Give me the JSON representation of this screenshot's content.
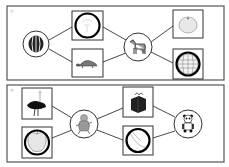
{
  "worksheet": {
    "panels": [
      {
        "label": "①",
        "nodes": [
          {
            "id": "watermelon",
            "shape": "circle",
            "picture": "watermelon",
            "marked": false
          },
          {
            "id": "sketch",
            "shape": "box",
            "picture": "faint-sketch",
            "marked": true
          },
          {
            "id": "turtle",
            "shape": "box",
            "picture": "turtle",
            "marked": false
          },
          {
            "id": "zebra",
            "shape": "circle",
            "picture": "zebra",
            "marked": false
          },
          {
            "id": "orange",
            "shape": "box",
            "picture": "orange",
            "marked": false
          },
          {
            "id": "globe",
            "shape": "box",
            "picture": "globe-ball",
            "marked": true
          }
        ]
      },
      {
        "label": "②",
        "nodes": [
          {
            "id": "ostrich",
            "shape": "box",
            "picture": "ostrich",
            "marked": false
          },
          {
            "id": "apple",
            "shape": "box",
            "picture": "apple",
            "marked": true
          },
          {
            "id": "monkey",
            "shape": "circle",
            "picture": "monkey",
            "marked": false
          },
          {
            "id": "gift",
            "shape": "box",
            "picture": "gift-box",
            "marked": false
          },
          {
            "id": "peel",
            "shape": "box",
            "picture": "banana-peel",
            "marked": true
          },
          {
            "id": "panda",
            "shape": "circle",
            "picture": "panda",
            "marked": false
          }
        ]
      }
    ],
    "colors": {
      "line": "#333333",
      "mark": "#000000",
      "border": "#555555"
    }
  }
}
